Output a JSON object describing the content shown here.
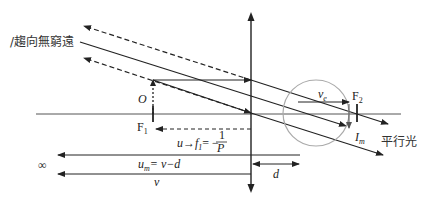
{
  "diagram": {
    "labels": {
      "toward_infinity": "/趨向無窮遠",
      "object": "O",
      "focus1": "F",
      "focus1_sub": "1",
      "focus2": "F",
      "focus2_sub": "2",
      "eye_image_distance": "v",
      "eye_image_distance_sub": "e",
      "image": "I",
      "image_sub": "m",
      "parallel_light": "平行光",
      "u_formula_prefix": "u→f",
      "u_formula_sub": "1",
      "u_formula_eq": "= −",
      "u_formula_num": "1",
      "u_formula_den": "P",
      "um_formula": "u",
      "um_formula_sub": "m",
      "um_formula_eq": "= v−d",
      "v_label": "v",
      "d_label": "d",
      "infinity": "∞"
    },
    "colors": {
      "line": "#222222",
      "eye_circle": "#aaaaaa",
      "axis": "#444444"
    }
  }
}
